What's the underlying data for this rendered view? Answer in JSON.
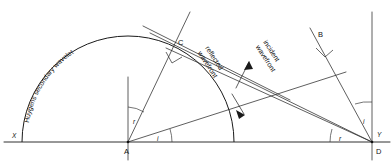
{
  "diagram": {
    "background_color": "#ffffff",
    "line_color": "#1a1a1a",
    "width": 392,
    "height": 168,
    "points": [
      {
        "id": "X",
        "label": "X",
        "x": 22,
        "y": 140,
        "label_x": 12,
        "label_y": 138
      },
      {
        "id": "A",
        "label": "A",
        "x": 128,
        "y": 142,
        "label_x": 125,
        "label_y": 153
      },
      {
        "id": "C",
        "label": "C",
        "x": 170,
        "y": 45,
        "label_x": 178,
        "label_y": 44
      },
      {
        "id": "B",
        "label": "B",
        "x": 322,
        "y": 44,
        "label_x": 319,
        "label_y": 36
      },
      {
        "id": "D",
        "label": "D",
        "x": 372,
        "y": 142,
        "label_x": 376,
        "label_y": 153
      },
      {
        "id": "Y",
        "label": "Y",
        "x": 383,
        "y": 140,
        "label_x": 378,
        "label_y": 136
      }
    ],
    "labels": {
      "huygens_wavelet": "Huygens secondary wavelet",
      "reflected_wavefront_line1": "reflected",
      "reflected_wavefront_line2": "wavefront",
      "incident_wavefront_line1": "incident",
      "incident_wavefront_line2": "wavefront"
    },
    "angles": [
      {
        "id": "angle-r-at-A",
        "label": "r",
        "x": 134,
        "y": 121
      },
      {
        "id": "angle-i-at-A",
        "label": "i",
        "x": 158,
        "y": 139
      },
      {
        "id": "angle-r-at-D",
        "label": "r",
        "x": 340,
        "y": 139
      },
      {
        "id": "angle-i-at-D",
        "label": "i",
        "x": 364,
        "y": 121
      }
    ],
    "geometry": {
      "baseline_y": 142,
      "baseline_x1": 4,
      "baseline_x2": 390,
      "arc_center_x": 128,
      "arc_center_y": 142,
      "arc_radius": 107,
      "normal_at_A_top_y": 77,
      "normal_at_D_top_y": 12,
      "angle_of_incidence_deg": 23,
      "angle_of_reflection_deg": 23
    }
  }
}
